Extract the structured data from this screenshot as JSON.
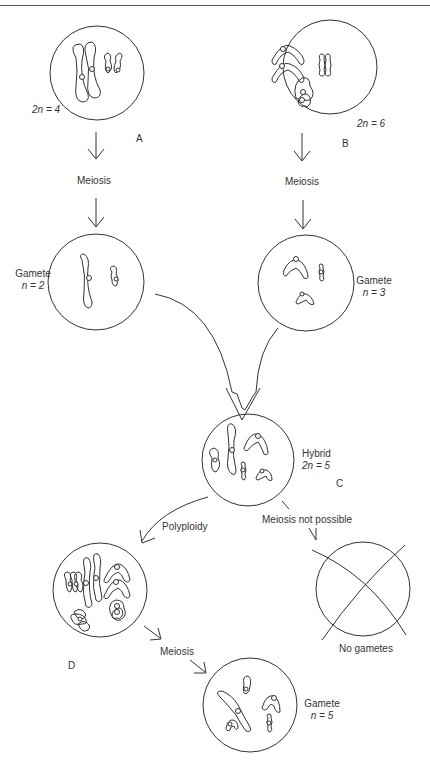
{
  "header": {
    "text": ""
  },
  "cells": {
    "A": {
      "letter": "A",
      "ploidy": "2n = 4"
    },
    "B": {
      "letter": "B",
      "ploidy": "2n = 6"
    },
    "gamete_a": {
      "title": "Gamete",
      "ploidy": "n = 2"
    },
    "gamete_b": {
      "title": "Gamete",
      "ploidy": "n = 3"
    },
    "C": {
      "letter": "C",
      "title": "Hybrid",
      "ploidy": "2n = 5"
    },
    "D": {
      "letter": "D"
    },
    "gamete_d": {
      "title": "Gamete",
      "ploidy": "n = 5"
    },
    "sterile": {
      "caption": "No gametes"
    }
  },
  "arrows": {
    "meiosis_a": "Meiosis",
    "meiosis_b": "Meiosis",
    "polyploidy": "Polyploidy",
    "meiosis_not_possible": "Meiosis not possible",
    "meiosis_d": "Meiosis"
  },
  "colors": {
    "line": "#333333",
    "background": "#ffffff"
  }
}
